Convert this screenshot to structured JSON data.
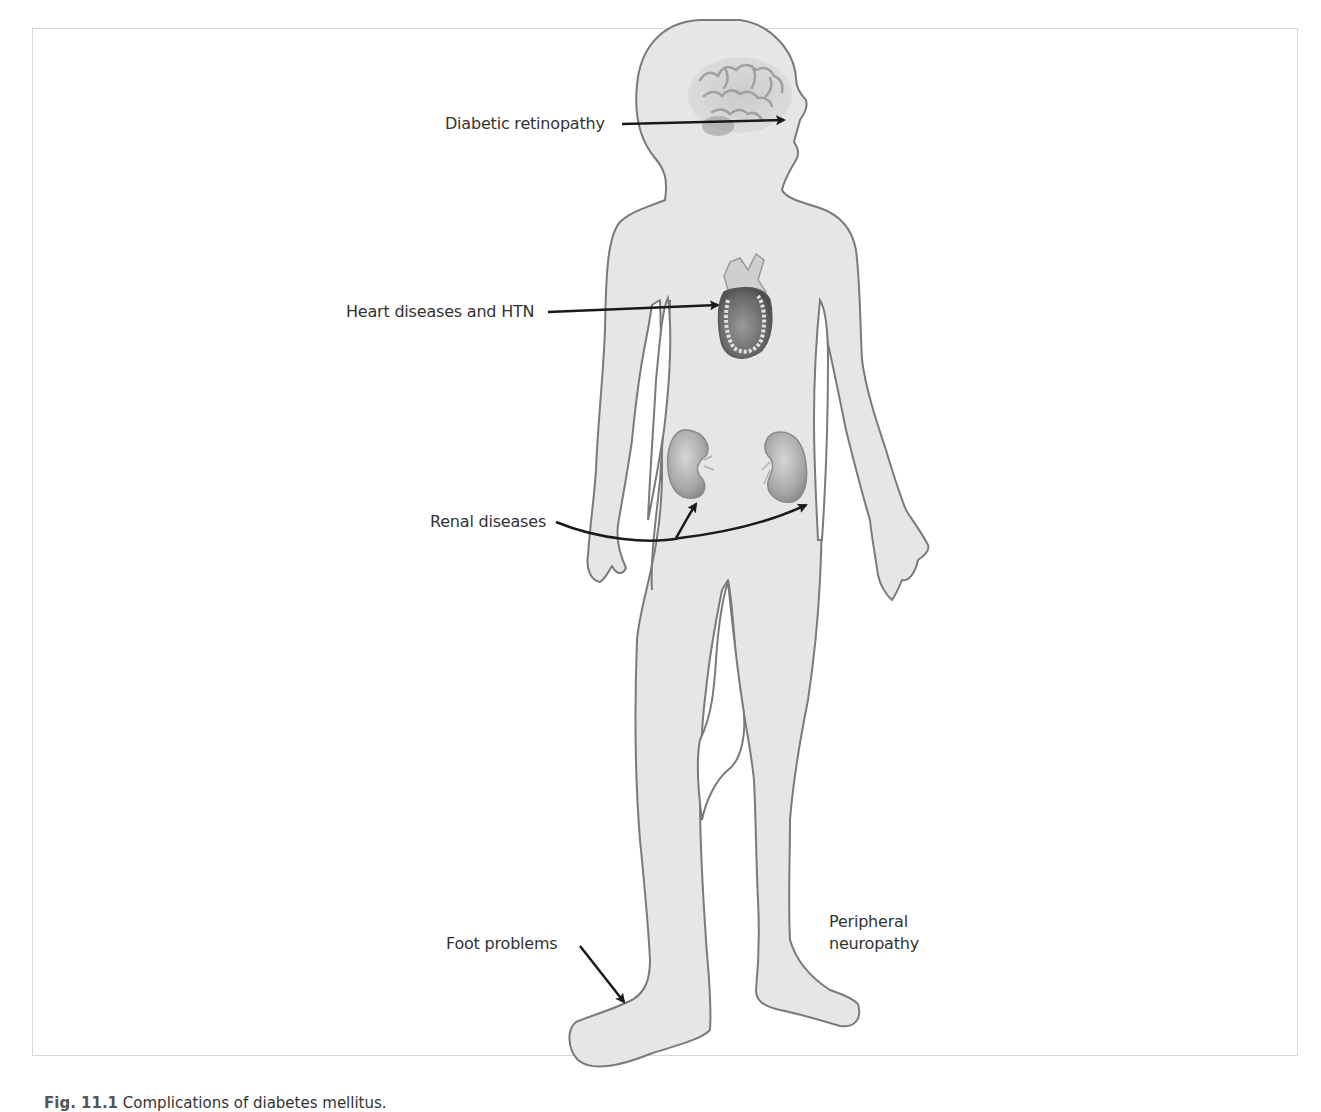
{
  "figure": {
    "title": "Complications of diabetes mellitus",
    "caption": {
      "number": "Fig. 11.1",
      "text": "Complications of diabetes mellitus."
    },
    "labels": [
      {
        "id": "retinopathy",
        "text": "Diabetic retinopathy",
        "target": "eye"
      },
      {
        "id": "heart",
        "text": "Heart diseases and HTN",
        "target": "heart"
      },
      {
        "id": "renal",
        "text": "Renal diseases",
        "target": "kidneys"
      },
      {
        "id": "foot",
        "text": "Foot problems",
        "target": "right-foot"
      },
      {
        "id": "neuropathy",
        "text": "Peripheral\nneuropathy",
        "target": "legs"
      }
    ],
    "organs": [
      "brain",
      "heart",
      "left-kidney",
      "right-kidney"
    ],
    "colors": {
      "body_fill": "#e6e6e6",
      "body_outline": "#7a7a7a",
      "arrow": "#1a1a1a",
      "text": "#333333",
      "frame": "#d8d8d8"
    }
  }
}
